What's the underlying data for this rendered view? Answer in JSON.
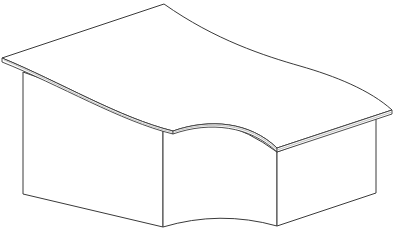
{
  "diagram": {
    "subject": "curved reception desk",
    "view": "isometric line drawing",
    "colors": {
      "background": "#ffffff",
      "line": "#3a3a3a",
      "edge_highlight": "#9a9a9a",
      "fill": "#ffffff"
    },
    "parts": [
      {
        "name": "desktop",
        "description": "thin curved worktop slab"
      },
      {
        "name": "left-panel",
        "description": "straight front panel, left wing"
      },
      {
        "name": "center-panel",
        "description": "concave curved front panel"
      },
      {
        "name": "right-panel",
        "description": "straight front panel, right wing"
      }
    ]
  }
}
